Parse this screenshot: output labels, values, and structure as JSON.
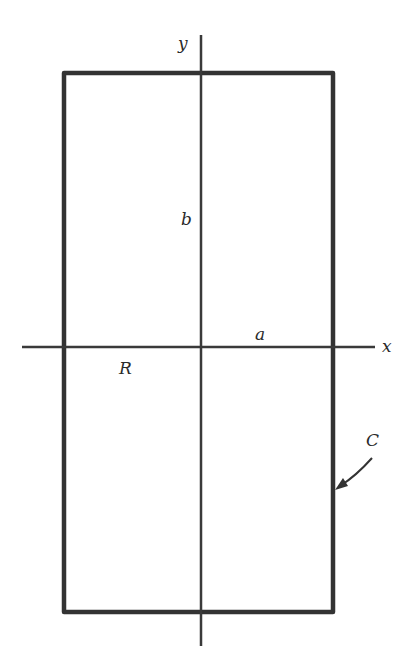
{
  "diagram": {
    "colors": {
      "ink": "#333333",
      "background": "#ffffff"
    },
    "axes": {
      "x_label": "x",
      "y_label": "y"
    },
    "labels": {
      "half_width": "a",
      "half_height": "b",
      "region": "R",
      "boundary": "C"
    }
  }
}
